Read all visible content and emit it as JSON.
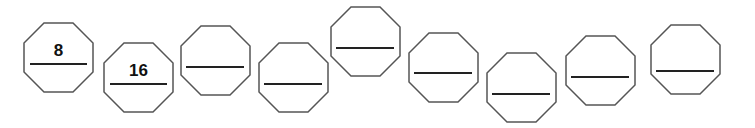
{
  "sequence": {
    "description": "Number sequence in octagons with blanks to fill",
    "octagons": [
      {
        "value": "8",
        "x": 23,
        "y": 22,
        "line_y": 42
      },
      {
        "value": "16",
        "x": 103,
        "y": 42,
        "line_y": 42
      },
      {
        "value": "",
        "x": 180,
        "y": 25,
        "line_y": 42
      },
      {
        "value": "",
        "x": 258,
        "y": 42,
        "line_y": 42
      },
      {
        "value": "",
        "x": 330,
        "y": 6,
        "line_y": 42
      },
      {
        "value": "",
        "x": 408,
        "y": 32,
        "line_y": 41
      },
      {
        "value": "",
        "x": 486,
        "y": 52,
        "line_y": 42
      },
      {
        "value": "",
        "x": 565,
        "y": 35,
        "line_y": 42
      },
      {
        "value": "",
        "x": 650,
        "y": 24,
        "line_y": 47
      }
    ]
  },
  "colors": {
    "stroke": "#555555",
    "line": "#222222",
    "text": "#111111"
  }
}
